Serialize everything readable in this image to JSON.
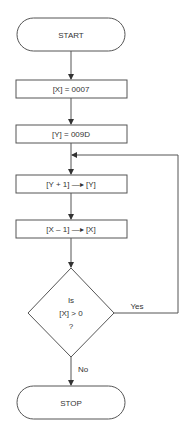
{
  "flowchart": {
    "start": {
      "label": "START"
    },
    "steps": [
      {
        "label": "[X] = 0007"
      },
      {
        "label": "[Y] = 009D"
      },
      {
        "label": "[Y + 1] —▸ [Y]"
      },
      {
        "label": "[X – 1] —▸ [X]"
      }
    ],
    "decision": {
      "line1": "Is",
      "line2": "[X] > 0",
      "line3": "?"
    },
    "branches": {
      "yes": "Yes",
      "no": "No"
    },
    "stop": {
      "label": "STOP"
    },
    "colors": {
      "stroke": "#555555",
      "text": "#333333",
      "background": "#ffffff"
    }
  }
}
